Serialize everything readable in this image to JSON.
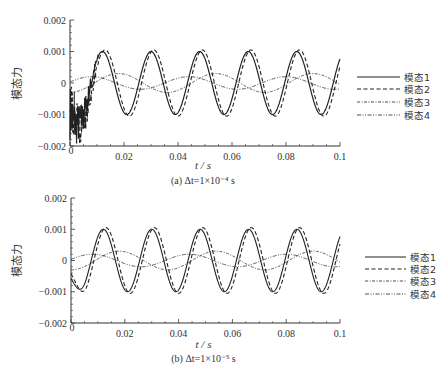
{
  "chart_data": [
    {
      "type": "line",
      "title": "",
      "caption": "(a) Δt=1×10⁻⁴ s",
      "xlabel": "t / s",
      "ylabel": "模态力",
      "xlim": [
        0,
        0.1
      ],
      "ylim": [
        -0.002,
        0.002
      ],
      "xticks": [
        "0",
        "0.02",
        "0.04",
        "0.06",
        "0.08",
        "0.1"
      ],
      "yticks": [
        "0.002",
        "0.001",
        "0",
        "−0.001",
        "−0.002"
      ],
      "grid": false,
      "legend_position": "right",
      "series": [
        {
          "name": "模态1",
          "style": "solid",
          "amplitude": 0.001,
          "period": 0.018,
          "first_peak_t": 0.012,
          "note": "strong high-frequency noise for t<0.01"
        },
        {
          "name": "模态2",
          "style": "dashed",
          "amplitude": 0.00105,
          "period": 0.018,
          "first_peak_t": 0.013
        },
        {
          "name": "模态3",
          "style": "dash-dot",
          "amplitude": 0.0003,
          "period": 0.036,
          "first_peak_t": 0.018
        },
        {
          "name": "模态4",
          "style": "dash-dot-dot",
          "amplitude": 0.0002,
          "period": 0.036,
          "first_peak_t": 0.008
        }
      ]
    },
    {
      "type": "line",
      "title": "",
      "caption": "(b) Δt=1×10⁻⁵ s",
      "xlabel": "t / s",
      "ylabel": "模态力",
      "xlim": [
        0,
        0.1
      ],
      "ylim": [
        -0.002,
        0.002
      ],
      "xticks": [
        "0",
        "0.02",
        "0.04",
        "0.06",
        "0.08",
        "0.1"
      ],
      "yticks": [
        "0.002",
        "0.001",
        "0",
        "−0.001",
        "−0.002"
      ],
      "grid": false,
      "legend_position": "right",
      "series": [
        {
          "name": "模态1",
          "style": "solid",
          "amplitude": 0.001,
          "period": 0.018,
          "first_peak_t": 0.012
        },
        {
          "name": "模态2",
          "style": "dashed",
          "amplitude": 0.00105,
          "period": 0.018,
          "first_peak_t": 0.013
        },
        {
          "name": "模态3",
          "style": "dash-dot",
          "amplitude": 0.0003,
          "period": 0.036,
          "first_peak_t": 0.018
        },
        {
          "name": "模态4",
          "style": "dash-dot-dot",
          "amplitude": 0.0002,
          "period": 0.036,
          "first_peak_t": 0.008
        }
      ]
    }
  ],
  "panels": [
    {
      "caption": "(a) Δt=1×10⁻⁴ s",
      "xlabel": "t / s",
      "ylabel": "模态力",
      "xticks": [
        "0",
        "0.02",
        "0.04",
        "0.06",
        "0.08",
        "0.1"
      ],
      "yticks": [
        "0.002",
        "0.001",
        "0",
        "−0.001",
        "−0.002"
      ],
      "legend": [
        "模态1",
        "模态2",
        "模态3",
        "模态4"
      ]
    },
    {
      "caption": "(b) Δt=1×10⁻⁵ s",
      "xlabel": "t / s",
      "ylabel": "模态力",
      "xticks": [
        "0",
        "0.02",
        "0.04",
        "0.06",
        "0.08",
        "0.1"
      ],
      "yticks": [
        "0.002",
        "0.001",
        "0",
        "−0.001",
        "−0.002"
      ],
      "legend": [
        "模态1",
        "模态2",
        "模态3",
        "模态4"
      ]
    }
  ],
  "colors": {
    "line": "#222222",
    "axis": "#333333"
  }
}
